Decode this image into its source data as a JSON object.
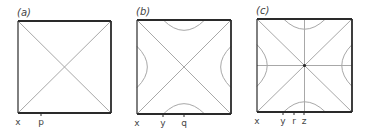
{
  "colors": {
    "frame": "#2a2a2a",
    "line": "#a8a8a8",
    "text": "#444444"
  },
  "panels": [
    {
      "id": "a",
      "label": "(a)",
      "box": {
        "x0": 18,
        "y0": 21,
        "x1": 111,
        "y1": 113
      },
      "has_curves": false,
      "has_cross": false,
      "ticks": [
        {
          "label": "x",
          "x": 18
        },
        {
          "label": "p",
          "x": 41
        }
      ]
    },
    {
      "id": "b",
      "label": "(b)",
      "box": {
        "x0": 137,
        "y0": 20,
        "x1": 231,
        "y1": 114
      },
      "has_curves": true,
      "has_cross": false,
      "ticks": [
        {
          "label": "x",
          "x": 137
        },
        {
          "label": "y",
          "x": 163
        },
        {
          "label": "q",
          "x": 184
        }
      ]
    },
    {
      "id": "c",
      "label": "(c)",
      "box": {
        "x0": 257,
        "y0": 19,
        "x1": 352,
        "y1": 112
      },
      "has_curves": true,
      "has_cross": true,
      "ticks": [
        {
          "label": "x",
          "x": 257
        },
        {
          "label": "y",
          "x": 283
        },
        {
          "label": "r",
          "x": 294
        },
        {
          "label": "z",
          "x": 304
        }
      ]
    }
  ]
}
